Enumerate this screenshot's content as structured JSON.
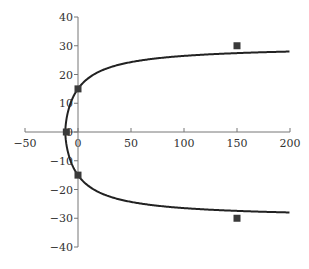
{
  "chart_data": {
    "type": "scatter",
    "title": "",
    "xlabel": "",
    "ylabel": "",
    "xlim": [
      -50,
      200
    ],
    "ylim": [
      -40,
      40
    ],
    "x_ticks": [
      -50,
      0,
      50,
      100,
      150,
      200
    ],
    "y_ticks": [
      -40,
      -30,
      -20,
      -10,
      0,
      10,
      20,
      30,
      40
    ],
    "grid": false,
    "legend": null,
    "series": [
      {
        "name": "data points",
        "style": "square-marker",
        "color": "#3a3a3a",
        "points": [
          [
            150,
            30
          ],
          [
            0,
            15
          ],
          [
            -11,
            0
          ],
          [
            0,
            -15
          ],
          [
            150,
            -30
          ]
        ]
      },
      {
        "name": "fitted curve",
        "style": "line",
        "color": "#222222",
        "description": "symmetric curve with vertex near (-12, 0), passing (0, ±15), approaching ±30 asymptotically",
        "points": [
          [
            -12,
            0
          ],
          [
            -10,
            7.7
          ],
          [
            -5,
            11.9
          ],
          [
            0,
            15
          ],
          [
            10,
            18.9
          ],
          [
            25,
            22.0
          ],
          [
            50,
            24.6
          ],
          [
            75,
            25.9
          ],
          [
            100,
            26.7
          ],
          [
            150,
            27.6
          ],
          [
            200,
            28.0
          ]
        ]
      }
    ]
  }
}
